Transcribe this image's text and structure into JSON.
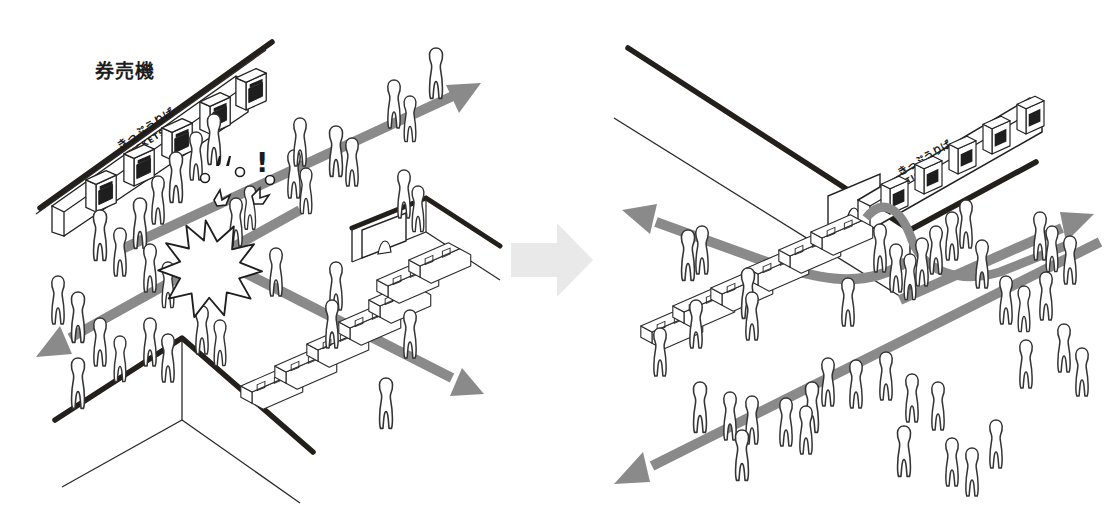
{
  "diagram": {
    "type": "before-after-isometric-flow",
    "title_visible": false,
    "background": "#ffffff",
    "ink": "#1d1d1d",
    "flow_arrow_color": "#8a8a8a",
    "flow_arrow_color_dark": "#7c7c7c",
    "transition_arrow_color": "#e9e9e9",
    "wall_edge_color": "#231f1b",
    "wall_line_color": "#2a2a2a",
    "figure_outline": "#333333",
    "figure_fill": "#ffffff",
    "bench_outline": "#2b2b2b",
    "bench_fill": "#ffffff"
  },
  "panels": [
    {
      "id": "before",
      "name": "before-panel",
      "caption": "券売機",
      "caption_romaji_meaning": "ticket vending machine",
      "machine_sign_line1": "きっぷうりば",
      "machine_sign_line2": "TICKETS",
      "conflict_marker": "!",
      "has_collision_burst": true,
      "ticket_machine_count": 5,
      "bench_count": 7,
      "flow_arrows": [
        {
          "name": "arrow-up-right",
          "direction": "up-right"
        },
        {
          "name": "arrow-down-left",
          "direction": "down-left"
        },
        {
          "name": "arrow-down-right",
          "direction": "down-right"
        }
      ]
    },
    {
      "id": "after",
      "name": "after-panel",
      "caption": "券売機",
      "caption_romaji_meaning": "ticket vending machine",
      "machine_sign_line1": "きっぷうりば",
      "machine_sign_line2": "TICKETS",
      "conflict_marker": "",
      "has_collision_burst": false,
      "ticket_machine_count": 5,
      "bench_count": 6,
      "flow_arrows": [
        {
          "name": "arrow-upper-left",
          "direction": "upper-left"
        },
        {
          "name": "arrow-lower-left",
          "direction": "lower-left"
        },
        {
          "name": "arrow-upper-right",
          "direction": "upper-right"
        }
      ]
    }
  ],
  "transition": {
    "name": "transition-arrow",
    "direction": "right",
    "label": ""
  }
}
